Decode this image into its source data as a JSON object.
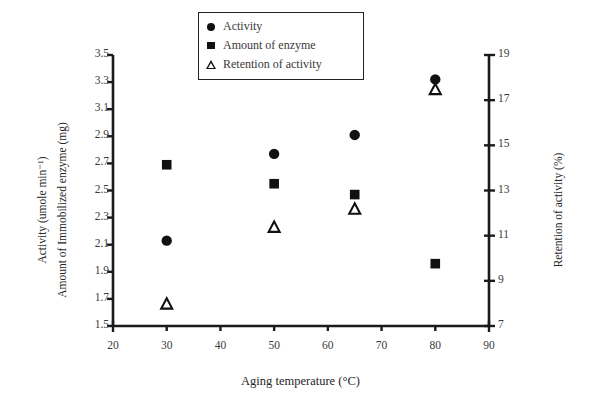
{
  "chart_data": {
    "type": "scatter",
    "title": "",
    "xlabel": "Aging temperature (°C)",
    "ylabel_left_line1": "Activity (umole min⁻¹)",
    "ylabel_left_line2": "Amount of Immobilized enzyme (mg)",
    "ylabel_right": "Retention of activity (%)",
    "x": [
      30,
      50,
      65,
      80
    ],
    "xlim": [
      20,
      90
    ],
    "xticks": [
      20,
      30,
      40,
      50,
      60,
      70,
      80,
      90
    ],
    "ylim_left": [
      1.5,
      3.5
    ],
    "yticks_left": [
      1.5,
      1.7,
      1.9,
      2.1,
      2.3,
      2.5,
      2.7,
      2.9,
      3.1,
      3.3,
      3.5
    ],
    "ylim_right": [
      7,
      19
    ],
    "yticks_right": [
      7,
      9,
      11,
      13,
      15,
      17,
      19
    ],
    "grid": false,
    "legend_position": "top-center",
    "series": [
      {
        "name": "Activity",
        "marker": "filled-circle",
        "axis": "left",
        "color": "#111111",
        "values": [
          2.13,
          2.77,
          2.91,
          3.32
        ]
      },
      {
        "name": "Amount of enzyme",
        "marker": "filled-square",
        "axis": "left",
        "color": "#111111",
        "values": [
          2.69,
          2.55,
          2.47,
          1.96
        ]
      },
      {
        "name": "Retention of activity",
        "marker": "open-triangle",
        "axis": "right",
        "color": "#111111",
        "values": [
          8.0,
          11.4,
          12.2,
          17.5
        ]
      }
    ]
  },
  "legend": {
    "items": [
      {
        "label": "Activity",
        "marker": "filled-circle"
      },
      {
        "label": "Amount of enzyme",
        "marker": "filled-square"
      },
      {
        "label": "Retention of activity",
        "marker": "open-triangle"
      }
    ]
  },
  "axes": {
    "x_title": "Aging temperature (°C)",
    "y_left_title_1": "Activity (umole min⁻¹)",
    "y_left_title_2": "Amount of Immobilized enzyme (mg)",
    "y_right_title": "Retention of activity (%)",
    "x_tick_labels": [
      "20",
      "30",
      "40",
      "50",
      "60",
      "70",
      "80",
      "90"
    ],
    "y_left_tick_labels": [
      "3.5",
      "3.3",
      "3.1",
      "2.9",
      "2.7",
      "2.5",
      "2.3",
      "2.1",
      "1.9",
      "1.7",
      "1.5"
    ],
    "y_right_tick_labels": [
      "19",
      "17",
      "15",
      "13",
      "11",
      "9",
      "7"
    ]
  },
  "colors": {
    "marker": "#111111",
    "axis": "#1a1a1a",
    "text": "#333333",
    "background": "#ffffff"
  }
}
